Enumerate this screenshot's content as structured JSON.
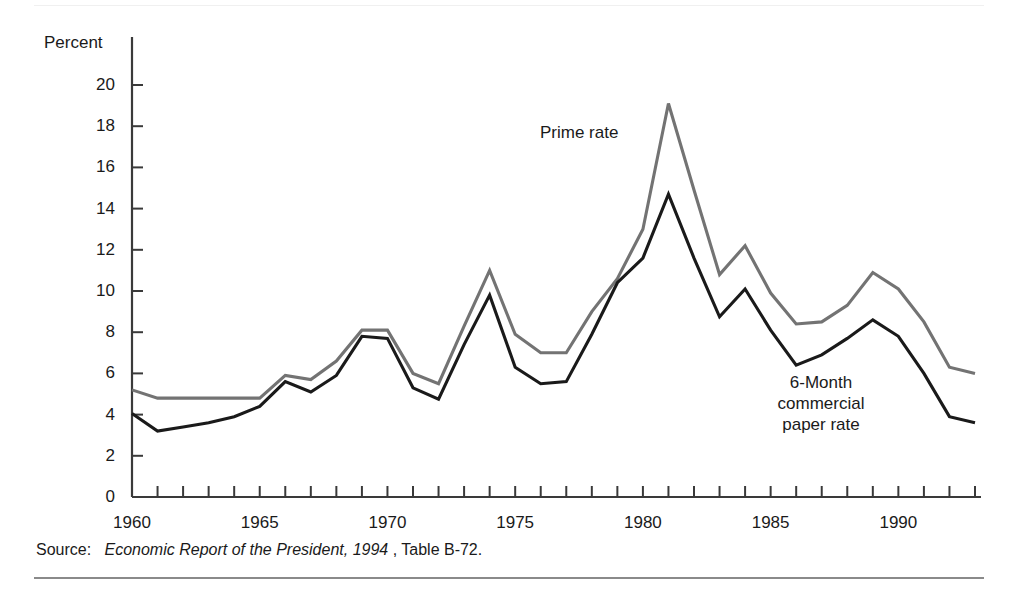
{
  "figure": {
    "axis_unit_label": "Percent",
    "source_note": {
      "label": "Source:",
      "publication": "Economic Report of the President, 1994",
      "tail": ", Table B-72."
    },
    "annotations": {
      "prime": "Prime rate",
      "commercial_paper": "6-Month\ncommercial\npaper rate"
    },
    "colors": {
      "prime_rate_line": "#737373",
      "commercial_paper_line": "#1a1a1a",
      "axis": "#3a3a3a",
      "rule_bottom": "#8a8a8a",
      "background": "#ffffff"
    }
  },
  "chart_data": {
    "type": "line",
    "title": "",
    "xlabel": "",
    "ylabel": "Percent",
    "xlim": [
      1960,
      1993
    ],
    "ylim": [
      0,
      20
    ],
    "grid": false,
    "legend": "annotated-inline",
    "y_ticks": [
      0,
      2,
      4,
      6,
      8,
      10,
      12,
      14,
      16,
      18,
      20
    ],
    "y_tick_labels": [
      "0",
      "2",
      "4",
      "6",
      "8",
      "10",
      "12",
      "14",
      "16",
      "18",
      "20"
    ],
    "x_ticks": [
      1960,
      1961,
      1962,
      1963,
      1964,
      1965,
      1966,
      1967,
      1968,
      1969,
      1970,
      1971,
      1972,
      1973,
      1974,
      1975,
      1976,
      1977,
      1978,
      1979,
      1980,
      1981,
      1982,
      1983,
      1984,
      1985,
      1986,
      1987,
      1988,
      1989,
      1990,
      1991,
      1992,
      1993
    ],
    "x_tick_labels": [
      "1960",
      "1965",
      "1970",
      "1975",
      "1980",
      "1985",
      "1990"
    ],
    "x_labeled_ticks": [
      1960,
      1965,
      1970,
      1975,
      1980,
      1985,
      1990
    ],
    "x": [
      1960,
      1961,
      1962,
      1963,
      1964,
      1965,
      1966,
      1967,
      1968,
      1969,
      1970,
      1971,
      1972,
      1973,
      1974,
      1975,
      1976,
      1977,
      1978,
      1979,
      1980,
      1981,
      1982,
      1983,
      1984,
      1985,
      1986,
      1987,
      1988,
      1989,
      1990,
      1991,
      1992,
      1993
    ],
    "series": [
      {
        "name": "Prime rate",
        "color": "#737373",
        "values": [
          5.2,
          4.8,
          4.8,
          4.8,
          4.8,
          4.8,
          5.9,
          5.7,
          6.6,
          8.1,
          8.1,
          6.0,
          5.5,
          8.3,
          11.0,
          7.9,
          7.0,
          7.0,
          9.0,
          10.6,
          13.0,
          19.1,
          14.9,
          10.8,
          12.2,
          9.9,
          8.4,
          8.5,
          9.3,
          10.9,
          10.1,
          8.5,
          6.3,
          6.0
        ]
      },
      {
        "name": "6-Month commercial paper rate",
        "color": "#1a1a1a",
        "values": [
          4.05,
          3.2,
          3.4,
          3.6,
          3.9,
          4.4,
          5.6,
          5.1,
          5.9,
          7.8,
          7.7,
          5.3,
          4.75,
          7.4,
          9.8,
          6.3,
          5.5,
          5.6,
          7.9,
          10.4,
          11.6,
          14.7,
          11.6,
          8.75,
          10.1,
          8.1,
          6.4,
          6.9,
          7.7,
          8.6,
          7.8,
          6.0,
          3.9,
          3.6
        ]
      }
    ]
  }
}
